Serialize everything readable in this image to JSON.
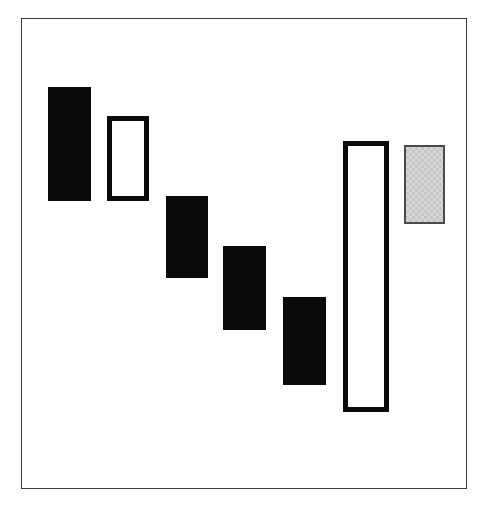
{
  "figure": {
    "canvas_width": 487,
    "canvas_height": 505,
    "background_color": "#ffffff"
  },
  "frame": {
    "name": "plot-border",
    "x": 21,
    "y": 18,
    "width": 446,
    "height": 471,
    "border_color": "#3a3a3a",
    "border_width": 1.5,
    "fill_color": "#ffffff"
  },
  "palette": {
    "solid_black": "#0a0a0a",
    "outline_black": "#0a0a0a",
    "gray_fill": "#d6d6d6",
    "gray_border": "#4a4a4a",
    "white_fill": "#ffffff",
    "frame_border": "#3a3a3a"
  },
  "chart_data": {
    "type": "bar",
    "subtitle": "",
    "xlabel": "",
    "ylabel": "",
    "grid": false,
    "legend": "none",
    "xlim": [
      21,
      467
    ],
    "ylim": [
      489,
      18
    ],
    "orientation": "vertical-ranges",
    "categories": [
      "1",
      "2",
      "3",
      "4",
      "5",
      "6",
      "7"
    ],
    "series": [
      {
        "name": "range-bars",
        "values": [
          114,
          85,
          82,
          84,
          88,
          271,
          79
        ]
      }
    ],
    "bars": [
      {
        "index": 1,
        "label": "bar-1",
        "style": "solid",
        "fill": "#0a0a0a",
        "stroke": "#0a0a0a",
        "stroke_width": 1,
        "x": 48,
        "y": 87,
        "width": 43,
        "height": 114,
        "x_center": 69.5,
        "top": 87,
        "bottom": 201
      },
      {
        "index": 2,
        "label": "bar-2",
        "style": "outline",
        "fill": "#ffffff",
        "stroke": "#0a0a0a",
        "stroke_width": 5,
        "x": 107,
        "y": 116,
        "width": 42,
        "height": 85,
        "x_center": 128,
        "top": 116,
        "bottom": 201
      },
      {
        "index": 3,
        "label": "bar-3",
        "style": "solid",
        "fill": "#0a0a0a",
        "stroke": "#0a0a0a",
        "stroke_width": 1,
        "x": 166,
        "y": 196,
        "width": 42,
        "height": 82,
        "x_center": 187,
        "top": 196,
        "bottom": 278
      },
      {
        "index": 4,
        "label": "bar-4",
        "style": "solid",
        "fill": "#0a0a0a",
        "stroke": "#0a0a0a",
        "stroke_width": 1,
        "x": 223,
        "y": 246,
        "width": 43,
        "height": 84,
        "x_center": 244.5,
        "top": 246,
        "bottom": 330
      },
      {
        "index": 5,
        "label": "bar-5",
        "style": "solid",
        "fill": "#0a0a0a",
        "stroke": "#0a0a0a",
        "stroke_width": 1,
        "x": 283,
        "y": 297,
        "width": 43,
        "height": 88,
        "x_center": 304.5,
        "top": 297,
        "bottom": 385
      },
      {
        "index": 6,
        "label": "bar-6",
        "style": "outline",
        "fill": "#ffffff",
        "stroke": "#0a0a0a",
        "stroke_width": 5,
        "x": 343,
        "y": 141,
        "width": 46,
        "height": 271,
        "x_center": 366,
        "top": 141,
        "bottom": 412
      },
      {
        "index": 7,
        "label": "bar-7",
        "style": "gray",
        "fill": "#d6d6d6",
        "stroke": "#4a4a4a",
        "stroke_width": 2,
        "x": 404,
        "y": 145,
        "width": 41,
        "height": 79,
        "x_center": 424.5,
        "top": 145,
        "bottom": 224
      }
    ]
  }
}
